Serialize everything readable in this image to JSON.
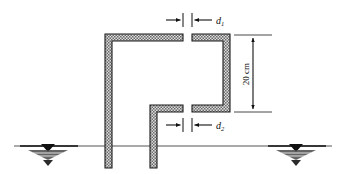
{
  "figure": {
    "background_color": "#ffffff",
    "line_color": "#1a1a1a",
    "hatch_color": "#6f6f6f",
    "hatch_background": "#d9d9d9"
  },
  "labels": {
    "d1": {
      "symbol": "d",
      "subscript": "1",
      "full": "d1"
    },
    "d2": {
      "symbol": "d",
      "subscript": "2",
      "full": "d2"
    },
    "height": {
      "value": "20",
      "unit": "cm",
      "full": "20 cm"
    }
  },
  "dimensions": [
    {
      "name": "gap-d1",
      "label": "d1",
      "orientation": "horizontal",
      "position": "top",
      "arrow_style": "outward-inward-pair"
    },
    {
      "name": "gap-d2",
      "label": "d2",
      "orientation": "horizontal",
      "position": "middle",
      "arrow_style": "outward-inward-pair"
    },
    {
      "name": "vertical-height",
      "label": "20 cm",
      "orientation": "vertical",
      "position": "right",
      "arrow_style": "double-headed"
    }
  ],
  "elements": {
    "left_tube": {
      "shape": "inverted-L",
      "fill": "hatched"
    },
    "middle_tube": {
      "shape": "inverted-L",
      "fill": "hatched"
    },
    "right_channel": {
      "shape": "C-bracket",
      "fill": "hatched"
    },
    "ground_line": {
      "style": "solid-horizontal"
    },
    "water_table_left": {
      "symbol": "water-table-triangle"
    },
    "water_table_right": {
      "symbol": "water-table-triangle"
    }
  }
}
